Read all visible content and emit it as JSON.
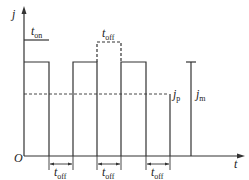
{
  "diagram": {
    "type": "pulse-current-waveform",
    "axes": {
      "y_label": "j",
      "x_label": "t",
      "origin_label": "O"
    },
    "labels": {
      "t_on": {
        "main": "t",
        "sub": "on"
      },
      "t_off_top": {
        "main": "t",
        "sub": "off"
      },
      "t_off_bottom": [
        {
          "main": "t",
          "sub": "off"
        },
        {
          "main": "t",
          "sub": "off"
        },
        {
          "main": "t",
          "sub": "off"
        }
      ],
      "j_p": {
        "main": "j",
        "sub": "p"
      },
      "j_m": {
        "main": "j",
        "sub": "m"
      }
    },
    "colors": {
      "line": "#333333",
      "background": "#ffffff"
    }
  }
}
